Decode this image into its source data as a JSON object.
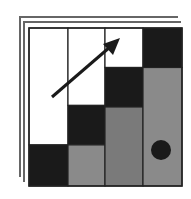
{
  "icon": {
    "name": "stacked-staircase-chart-icon",
    "colors": {
      "background": "#ffffff",
      "dark": "#1a1a1a",
      "mid_gray": "#8a8a8a",
      "darker_gray": "#7a7a7a",
      "line": "#555555",
      "white": "#ffffff"
    },
    "columns": [
      {
        "segments": [
          "white",
          "dark"
        ],
        "splits": [
          0.74
        ]
      },
      {
        "segments": [
          "white",
          "dark",
          "mid_gray"
        ],
        "splits": [
          0.49,
          0.74
        ]
      },
      {
        "segments": [
          "white",
          "dark",
          "darker_gray"
        ],
        "splits": [
          0.25,
          0.5
        ]
      },
      {
        "segments": [
          "dark",
          "mid_gray"
        ],
        "splits": [
          0.25
        ]
      }
    ],
    "marker": "circle",
    "arrow": "up-right"
  }
}
